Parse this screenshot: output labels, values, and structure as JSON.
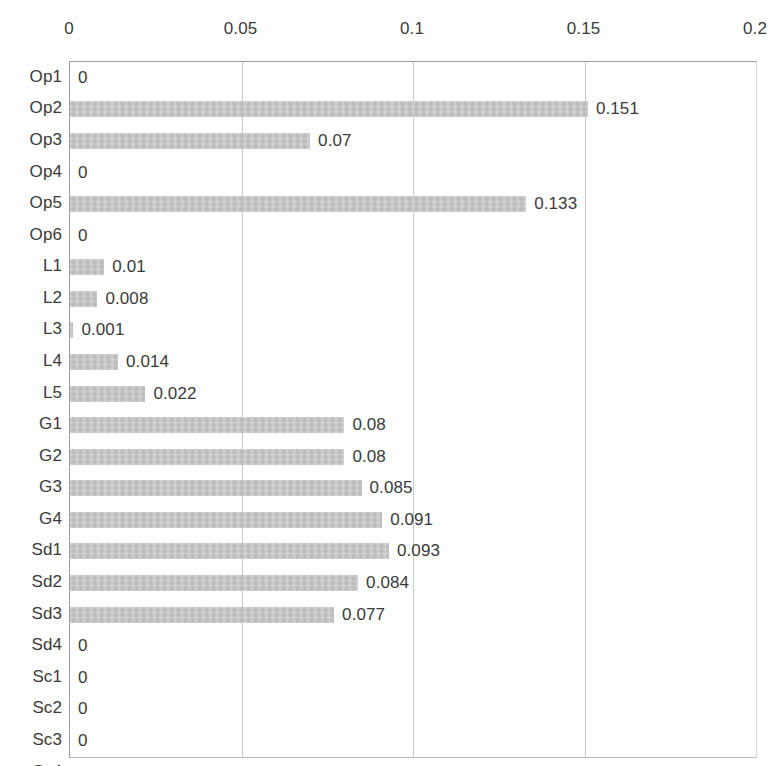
{
  "chart_data": {
    "type": "bar",
    "orientation": "horizontal",
    "title": "",
    "xlabel": "",
    "ylabel": "",
    "xlim": [
      0,
      0.2
    ],
    "xticks": [
      "0",
      "0.05",
      "0.1",
      "0.15",
      "0.2"
    ],
    "xtick_values": [
      0,
      0.05,
      0.1,
      0.15,
      0.2
    ],
    "grid": true,
    "legend": false,
    "bar_color": "#bfbfbf",
    "categories": [
      "Op1",
      "Op2",
      "Op3",
      "Op4",
      "Op5",
      "Op6",
      "L1",
      "L2",
      "L3",
      "L4",
      "L5",
      "G1",
      "G2",
      "G3",
      "G4",
      "Sd1",
      "Sd2",
      "Sd3",
      "Sd4",
      "Sc1",
      "Sc2",
      "Sc3",
      "Sc4"
    ],
    "values": [
      0,
      0.151,
      0.07,
      0,
      0.133,
      0,
      0.01,
      0.008,
      0.001,
      0.014,
      0.022,
      0.08,
      0.08,
      0.085,
      0.091,
      0.093,
      0.084,
      0.077,
      0,
      0,
      0,
      0,
      0
    ],
    "data_labels": [
      "0",
      "0.151",
      "0.07",
      "0",
      "0.133",
      "0",
      "0.01",
      "0.008",
      "0.001",
      "0.014",
      "0.022",
      "0.08",
      "0.08",
      "0.085",
      "0.091",
      "0.093",
      "0.084",
      "0.077",
      "0",
      "0",
      "0",
      "0",
      "0"
    ]
  }
}
